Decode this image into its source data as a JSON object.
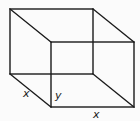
{
  "diagram": {
    "type": "wireframe-cuboid",
    "stroke_color": "#1a1a1a",
    "background_color": "#fbfbfb",
    "labels": {
      "depth_edge": "x",
      "height_edge": "y",
      "width_edge": "x"
    }
  }
}
